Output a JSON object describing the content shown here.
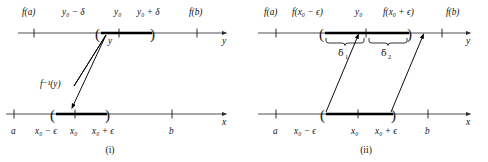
{
  "figure": {
    "title_absent": true,
    "panels": [
      {
        "id": "panel-i",
        "caption": "(i)",
        "y_axis": {
          "axis_name": "y",
          "labels_above": [
            "f(a)",
            "y₀ − δ",
            "y₀",
            "y₀ + δ",
            "f(b)"
          ],
          "label_f_a": "f(a)",
          "label_y0_minus_delta": "y₀ − δ",
          "label_y0": "y₀",
          "label_y0_plus_delta": "y₀ + δ",
          "label_f_b": "f(b)",
          "interval_open_paren": "(",
          "interval_close_paren": ")",
          "point_label": "y"
        },
        "x_axis": {
          "axis_name": "x",
          "labels_below": [
            "a",
            "x₀ − ϵ",
            "x₀",
            "x₀ + ϵ",
            "b"
          ],
          "label_a": "a",
          "label_x0_minus_eps": "x₀ − ϵ",
          "label_x0": "x₀",
          "label_x0_plus_eps": "x₀ + ϵ",
          "label_b": "b",
          "interval_open_paren": "(",
          "interval_close_paren": ")",
          "preimage_label": "f⁻¹(y)"
        }
      },
      {
        "id": "panel-ii",
        "caption": "(ii)",
        "y_axis": {
          "axis_name": "y",
          "labels_above": [
            "f(a)",
            "f(x₀ − ϵ)",
            "y₀",
            "f(x₀ + ϵ)",
            "f(b)"
          ],
          "label_f_a": "f(a)",
          "label_f_x0_minus_eps": "f(x₀ − ϵ)",
          "label_y0": "y₀",
          "label_f_x0_plus_eps": "f(x₀ + ϵ)",
          "label_f_b": "f(b)",
          "interval_open_paren": "(",
          "interval_close_paren": ")",
          "brace_left_label": "δ",
          "brace_left_sub": "1",
          "brace_right_label": "δ",
          "brace_right_sub": "2"
        },
        "x_axis": {
          "axis_name": "x",
          "labels_below": [
            "a",
            "x₀ − ϵ",
            "x₀",
            "x₀ + ϵ",
            "b"
          ],
          "label_a": "a",
          "label_x0_minus_eps": "x₀ − ϵ",
          "label_x0": "x₀",
          "label_x0_plus_eps": "x₀ + ϵ",
          "label_b": "b",
          "interval_open_paren": "(",
          "interval_close_paren": ")"
        }
      }
    ]
  },
  "colors": {
    "ink": "#111111",
    "axis": "#3a3a3a",
    "emphasis": "#000000",
    "background": "#ffffff"
  }
}
